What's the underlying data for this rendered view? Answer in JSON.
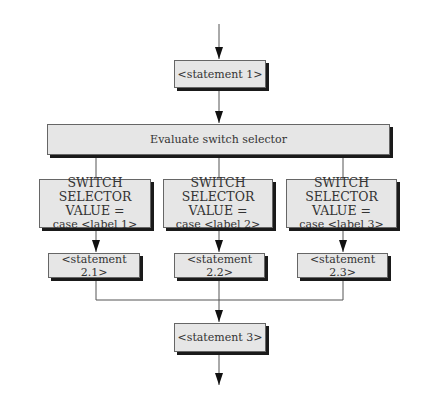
{
  "diagram": {
    "type": "flowchart",
    "title": "",
    "statement1": "<statement 1>",
    "evaluate": "Evaluate switch selector",
    "cases": [
      {
        "line1": "SWITCH SELECTOR",
        "line2": "VALUE =",
        "line3": "case <label 1>",
        "statement": "<statement 2.1>"
      },
      {
        "line1": "SWITCH SELECTOR",
        "line2": "VALUE =",
        "line3": "case <label 2>",
        "statement": "<statement 2.2>"
      },
      {
        "line1": "SWITCH SELECTOR",
        "line2": "VALUE =",
        "line3": "case <label 3>",
        "statement": "<statement 2.3>"
      }
    ],
    "statement3": "<statement 3>",
    "colors": {
      "box_fill": "#e6e6e6",
      "box_border": "#666666",
      "shadow": "#1a1a1a",
      "line": "#555555"
    }
  }
}
